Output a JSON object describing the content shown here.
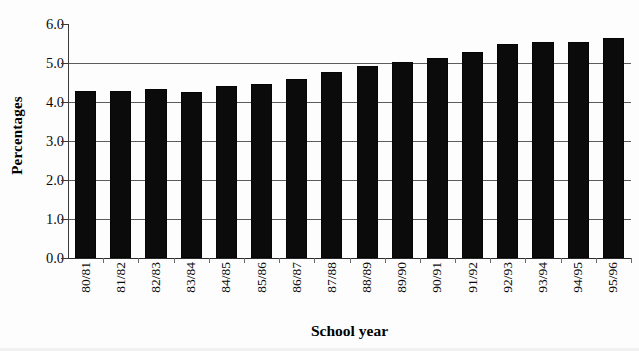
{
  "chart_data": {
    "type": "bar",
    "title": "",
    "xlabel": "School year",
    "ylabel": "Percentages",
    "categories": [
      "80/81",
      "81/82",
      "82/83",
      "83/84",
      "84/85",
      "85/86",
      "86/87",
      "87/88",
      "88/89",
      "89/90",
      "90/91",
      "91/92",
      "92/93",
      "93/94",
      "94/95",
      "95/96"
    ],
    "values": [
      4.27,
      4.27,
      4.33,
      4.26,
      4.4,
      4.47,
      4.6,
      4.78,
      4.93,
      5.02,
      5.12,
      5.27,
      5.48,
      5.53,
      5.55,
      5.65
    ],
    "ylim": [
      0.0,
      6.0
    ],
    "ytick_labels": [
      "6.0",
      "5.0",
      "4.0",
      "3.0",
      "2.0",
      "1.0",
      "0.0"
    ],
    "ytick_values": [
      6.0,
      5.0,
      4.0,
      3.0,
      2.0,
      1.0,
      0.0
    ],
    "grid": true,
    "legend": "none",
    "bar_color": "#0b0b0b",
    "gridline_color": "#5d5d5d",
    "axis_color": "#3a3a3a"
  }
}
